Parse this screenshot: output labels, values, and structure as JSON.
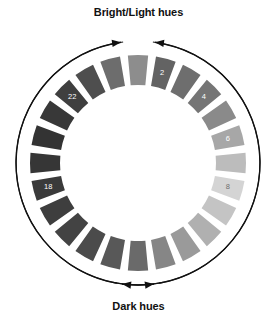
{
  "figure": {
    "title_top": "Bright/Light hues",
    "title_bottom": "Dark hues",
    "type": "hue-value-wheel"
  },
  "chart_data": {
    "type": "pie",
    "subtitle": "",
    "xlabel": "",
    "ylabel": "",
    "legend_position": "none",
    "grid": false,
    "annotations": [
      {
        "text": "Bright/Light hues",
        "position": "top",
        "arrows": 2,
        "arrow_direction": "converging-up"
      },
      {
        "text": "Dark hues",
        "position": "bottom",
        "arrows": 2,
        "arrow_direction": "converging-down"
      }
    ],
    "segment_count": 24,
    "gap_degrees": 4.2,
    "inner_radius": 78,
    "outer_radius": 108,
    "center": [
      138,
      163
    ],
    "start_angle_deg": -90,
    "categories": [
      "1",
      "2",
      "3",
      "4",
      "5",
      "6",
      "7",
      "8",
      "9",
      "10",
      "11",
      "12",
      "13",
      "14",
      "15",
      "16",
      "17",
      "18",
      "19",
      "20",
      "21",
      "22",
      "23",
      "24"
    ],
    "values": [
      24,
      24,
      24,
      24,
      24,
      24,
      24,
      24,
      24,
      24,
      24,
      24,
      24,
      24,
      24,
      24,
      24,
      24,
      24,
      24,
      24,
      24,
      24,
      24
    ],
    "series": [
      {
        "name": "segment-lightness",
        "values": [
          72,
          62,
          55,
          51,
          58,
          64,
          74,
          87,
          78,
          70,
          62,
          55,
          48,
          42,
          36,
          31,
          28,
          26,
          24,
          23,
          25,
          30,
          40,
          56
        ]
      }
    ],
    "segments": [
      {
        "index": 1,
        "label": "",
        "color": "#8d8d8d",
        "angle_deg": -15.0
      },
      {
        "index": 2,
        "label": "2",
        "color": "#636363",
        "angle_deg": -30.0
      },
      {
        "index": 3,
        "label": "",
        "color": "#6e6e6e",
        "angle_deg": -45.0
      },
      {
        "index": 4,
        "label": "4",
        "color": "#757575",
        "angle_deg": -60.0
      },
      {
        "index": 5,
        "label": "",
        "color": "#8a8a8a",
        "angle_deg": -75.0
      },
      {
        "index": 6,
        "label": "6",
        "color": "#a7a7a7",
        "angle_deg": -90.0
      },
      {
        "index": 7,
        "label": "",
        "color": "#bcbcbc",
        "angle_deg": -105.0
      },
      {
        "index": 8,
        "label": "8",
        "color": "#d4d4d4",
        "angle_deg": -120.0
      },
      {
        "index": 9,
        "label": "",
        "color": "#c4c4c4",
        "angle_deg": -135.0
      },
      {
        "index": 10,
        "label": "",
        "color": "#b0b0b0",
        "angle_deg": -150.0
      },
      {
        "index": 11,
        "label": "",
        "color": "#9a9a9a",
        "angle_deg": -165.0
      },
      {
        "index": 12,
        "label": "",
        "color": "#868686",
        "angle_deg": 180.0
      },
      {
        "index": 13,
        "label": "",
        "color": "#6a6a6a",
        "angle_deg": 165.0
      },
      {
        "index": 14,
        "label": "",
        "color": "#585858",
        "angle_deg": 150.0
      },
      {
        "index": 15,
        "label": "",
        "color": "#4b4b4b",
        "angle_deg": 135.0
      },
      {
        "index": 16,
        "label": "",
        "color": "#434343",
        "angle_deg": 120.0
      },
      {
        "index": 17,
        "label": "",
        "color": "#3e3e3e",
        "angle_deg": 105.0
      },
      {
        "index": 18,
        "label": "18",
        "color": "#3a3a3a",
        "angle_deg": 90.0
      },
      {
        "index": 19,
        "label": "",
        "color": "#363636",
        "angle_deg": 75.0
      },
      {
        "index": 20,
        "label": "",
        "color": "#333333",
        "angle_deg": 60.0
      },
      {
        "index": 21,
        "label": "",
        "color": "#383838",
        "angle_deg": 45.0
      },
      {
        "index": 22,
        "label": "22",
        "color": "#3f3f3f",
        "angle_deg": 30.0
      },
      {
        "index": 23,
        "label": "",
        "color": "#4e4e4e",
        "angle_deg": 15.0
      },
      {
        "index": 24,
        "label": "",
        "color": "#6d6d6d",
        "angle_deg": 0.0
      }
    ],
    "visible_labels": [
      "2",
      "4",
      "6",
      "8",
      "18",
      "22"
    ],
    "colors": {
      "background": "#ffffff",
      "outline": "#1a1a1a",
      "arrow": "#111111",
      "text": "#111111",
      "label_on_dark": "#ffffff",
      "label_on_light": "#6e6e6e",
      "lightest_segment": "#d4d4d4",
      "darkest_segment": "#333333"
    }
  }
}
